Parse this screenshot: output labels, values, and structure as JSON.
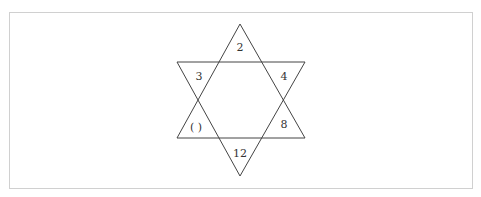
{
  "diagram": {
    "type": "hexagram-number-puzzle",
    "frame_color": "#d0d0d0",
    "line_color": "#444444",
    "text_color": "#333333",
    "triangles": {
      "upward": {
        "points": [
          [
            240,
            24
          ],
          [
            177,
            138
          ],
          [
            305,
            138
          ]
        ]
      },
      "downward": {
        "points": [
          [
            177,
            62
          ],
          [
            305,
            62
          ],
          [
            240,
            176
          ]
        ]
      }
    },
    "cells": [
      {
        "position": "top",
        "value": "2",
        "x": 240,
        "y": 51
      },
      {
        "position": "upper-left",
        "value": "3",
        "x": 199,
        "y": 80
      },
      {
        "position": "upper-right",
        "value": "4",
        "x": 284,
        "y": 80
      },
      {
        "position": "lower-left",
        "value": "( )",
        "x": 196,
        "y": 131
      },
      {
        "position": "lower-right",
        "value": "8",
        "x": 284,
        "y": 128
      },
      {
        "position": "bottom",
        "value": "12",
        "x": 240,
        "y": 157
      }
    ]
  }
}
